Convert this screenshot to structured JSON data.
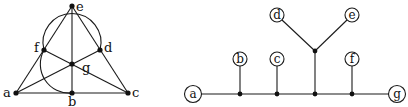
{
  "left_figure": {
    "type": "fano-plane",
    "points": [
      {
        "id": "a",
        "label": "a",
        "x": 16,
        "y": 93
      },
      {
        "id": "b",
        "label": "b",
        "x": 72,
        "y": 93
      },
      {
        "id": "c",
        "label": "c",
        "x": 128,
        "y": 93
      },
      {
        "id": "d",
        "label": "d",
        "x": 100,
        "y": 50
      },
      {
        "id": "e",
        "label": "e",
        "x": 72,
        "y": 6
      },
      {
        "id": "f",
        "label": "f",
        "x": 44,
        "y": 50
      },
      {
        "id": "g",
        "label": "g",
        "x": 72,
        "y": 64
      }
    ]
  },
  "right_figure": {
    "type": "tree",
    "nodes": [
      {
        "id": "a",
        "label": "a"
      },
      {
        "id": "b",
        "label": "b"
      },
      {
        "id": "c",
        "label": "c"
      },
      {
        "id": "d",
        "label": "d"
      },
      {
        "id": "e",
        "label": "e"
      },
      {
        "id": "f",
        "label": "f"
      },
      {
        "id": "g",
        "label": "g"
      }
    ]
  },
  "colors": {
    "stroke": "#1a1a1a",
    "background": "#ffffff"
  }
}
